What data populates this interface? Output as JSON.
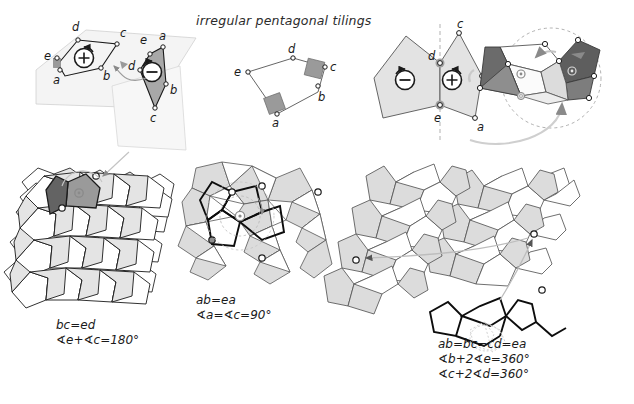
{
  "figure": {
    "title": "irregular pentagonal tilings",
    "background_color": "#ffffff",
    "ink_color": "#1a1a1a",
    "fill_light": "#e8e8e8",
    "fill_mid": "#bdbdbd",
    "fill_dark": "#6e6e6e",
    "fill_darker": "#4a4a4a",
    "plane_fill": "#f2f2f2"
  },
  "columns": [
    {
      "id": "column-1",
      "construction": {
        "name": "pentagon-pair-on-folded-planes",
        "vertex_labels": [
          "a",
          "b",
          "c",
          "d",
          "e"
        ],
        "rotation_markers": [
          "+",
          "−"
        ],
        "marker_plus": "+",
        "marker_minus": "−"
      },
      "tiling": {
        "name": "tiling-bc-ed",
        "highlight_marker": "⊙"
      },
      "caption": {
        "line1": "bc=ed",
        "line2": "∢e+∢c=180°"
      }
    },
    {
      "id": "column-2",
      "construction": {
        "name": "pentagon-two-right-angles",
        "vertex_labels": [
          "a",
          "b",
          "c",
          "d",
          "e"
        ],
        "right_angle_vertices": [
          "a",
          "c"
        ]
      },
      "tiling": {
        "name": "tiling-cairo-like",
        "highlight_marker": "⊙"
      },
      "caption": {
        "line1": "ab=ea",
        "line2": "∢a=∢c=90°"
      }
    },
    {
      "id": "column-3",
      "construction": {
        "name": "pentagon-pair-mirror-rotation",
        "vertex_labels": [
          "a",
          "b",
          "c",
          "d",
          "e"
        ],
        "rotation_markers": [
          "−",
          "+"
        ],
        "marker_plus": "+",
        "marker_minus": "−"
      },
      "tiling": {
        "name": "tiling-ab-bc-cd-ea",
        "highlight_marker": "⊙"
      },
      "caption": {
        "line1": "ab=bc=cd=ea",
        "line2": "∢b+2∢e=360°",
        "line3": "∢c+2∢d=360°"
      }
    }
  ],
  "labels": {
    "a": "a",
    "b": "b",
    "c": "c",
    "d": "d",
    "e": "e",
    "plus": "+",
    "minus": "−"
  }
}
